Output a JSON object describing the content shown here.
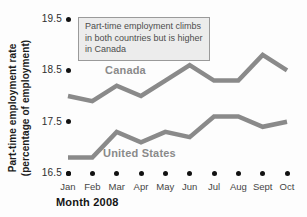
{
  "chart_data": {
    "type": "line",
    "x": [
      "Jan",
      "Feb",
      "Mar",
      "Apr",
      "May",
      "Jun",
      "Jul",
      "Aug",
      "Sept",
      "Oct"
    ],
    "xlabel": "Month 2008",
    "ylabel_line1": "Part-time employment rate",
    "ylabel_line2": "(percentage of employment)",
    "y_ticks": [
      "19.5",
      "18.5",
      "17.5",
      "16.5"
    ],
    "ylim": [
      16.5,
      19.5
    ],
    "grid": false,
    "legend": "inline-labels",
    "annotation": "Part-time employment climbs\nin both countries but is higher\nin Canada",
    "series": [
      {
        "name": "Canada",
        "values": [
          18.0,
          17.9,
          18.2,
          18.0,
          18.3,
          18.6,
          18.3,
          18.3,
          18.8,
          18.5
        ]
      },
      {
        "name": "United States",
        "values": [
          16.8,
          16.8,
          17.3,
          17.1,
          17.3,
          17.2,
          17.6,
          17.6,
          17.4,
          17.5
        ]
      }
    ]
  },
  "colors": {
    "line": "#8a8a8a",
    "series_label": "#8a8a8a",
    "tick_dot": "#111111",
    "y_tick_text": "#2e2e2e",
    "x_tick_text": "#454545",
    "axis_title_text": "#1c1c1c",
    "annotation_bg": "#ececec",
    "annotation_border": "#9a9a9a",
    "annotation_text": "#4d4d4d",
    "background": "#fdfdfd"
  }
}
